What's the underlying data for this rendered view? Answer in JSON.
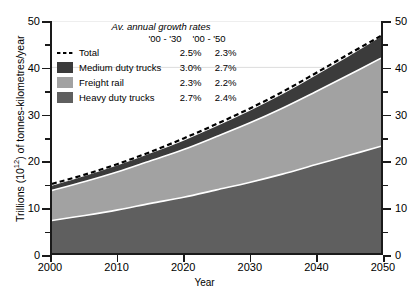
{
  "chart_data": {
    "type": "area",
    "stacked": true,
    "title": "",
    "xlabel": "Year",
    "ylabel": "Trillions (10¹²) of tonnes-kilometres/year",
    "xlim": [
      2000,
      2050
    ],
    "ylim": [
      0,
      50
    ],
    "xticks": [
      2000,
      2010,
      2020,
      2030,
      2040,
      2050
    ],
    "yticks": [
      0,
      10,
      20,
      30,
      40,
      50
    ],
    "y_minor_ticks": [
      5,
      15,
      25,
      35,
      45
    ],
    "grid": "horizontal-faint",
    "dual_y_axis": true,
    "legend_position": "upper-left-inside",
    "x": [
      2000,
      2005,
      2010,
      2015,
      2020,
      2025,
      2030,
      2035,
      2040,
      2045,
      2050
    ],
    "series": [
      {
        "name": "Heavy duty trucks",
        "color": "#5f5f5f",
        "kind": "stacked-area",
        "order": 1,
        "values": [
          7.0,
          8.1,
          9.3,
          10.7,
          12.0,
          13.6,
          15.2,
          17.0,
          19.0,
          21.0,
          23.0
        ]
      },
      {
        "name": "Freight rail",
        "color": "#a2a2a2",
        "kind": "stacked-area",
        "order": 2,
        "values": [
          6.5,
          7.3,
          8.2,
          9.2,
          10.3,
          11.5,
          12.8,
          14.2,
          15.7,
          17.3,
          19.0
        ]
      },
      {
        "name": "Medium duty trucks",
        "color": "#3b3b3b",
        "kind": "stacked-area",
        "order": 3,
        "values": [
          1.0,
          1.2,
          1.4,
          1.6,
          1.9,
          2.2,
          2.6,
          3.0,
          3.5,
          4.0,
          4.6
        ]
      },
      {
        "name": "Total",
        "color": "#000000",
        "kind": "dashed-line",
        "order": 4,
        "values": [
          14.9,
          16.9,
          19.2,
          21.8,
          24.7,
          27.8,
          31.1,
          34.7,
          38.7,
          42.8,
          46.8
        ]
      }
    ],
    "cumulative_top": {
      "heavy_duty_trucks": [
        7.0,
        8.1,
        9.3,
        10.7,
        12.0,
        13.6,
        15.2,
        17.0,
        19.0,
        21.0,
        23.0
      ],
      "freight_rail": [
        13.5,
        15.4,
        17.5,
        19.9,
        22.3,
        25.1,
        28.0,
        31.2,
        34.7,
        38.3,
        42.0
      ],
      "medium_duty_trucks": [
        14.5,
        16.6,
        18.9,
        21.5,
        24.2,
        27.3,
        30.6,
        34.2,
        38.2,
        42.3,
        46.6
      ]
    }
  },
  "legend": {
    "title": "Av. annual growth rates",
    "col_headers": [
      "'00 - '30",
      "'00 - '50"
    ],
    "rows": [
      {
        "label": "Total",
        "marker": "dashed-line",
        "color": "#000000",
        "rate_2030": "2.5%",
        "rate_2050": "2.3%"
      },
      {
        "label": "Medium duty trucks",
        "marker": "swatch",
        "color": "#3b3b3b",
        "rate_2030": "3.0%",
        "rate_2050": "2.7%"
      },
      {
        "label": "Freight rail",
        "marker": "swatch",
        "color": "#a2a2a2",
        "rate_2030": "2.3%",
        "rate_2050": "2.2%"
      },
      {
        "label": "Heavy duty trucks",
        "marker": "swatch",
        "color": "#5f5f5f",
        "rate_2030": "2.7%",
        "rate_2050": "2.4%"
      }
    ]
  },
  "axes": {
    "x_title": "Year",
    "y_title_pre": "Trillions (10",
    "y_title_sup": "12",
    "y_title_post": ") of tonnes-kilometres/year",
    "x_tick_labels": [
      "2000",
      "2010",
      "2020",
      "2030",
      "2040",
      "2050"
    ],
    "y_tick_labels_left": [
      "50",
      "40",
      "30",
      "20",
      "10",
      "0"
    ],
    "y_tick_labels_right": [
      "50",
      "40",
      "30",
      "20",
      "10",
      "0"
    ]
  },
  "colors": {
    "medium_duty_trucks": "#3b3b3b",
    "freight_rail": "#a2a2a2",
    "heavy_duty_trucks": "#5f5f5f",
    "total_line": "#000000",
    "axis": "#1a1a1a",
    "gridline": "#dcdcdc",
    "separator": "#ffffff",
    "background": "#ffffff"
  }
}
